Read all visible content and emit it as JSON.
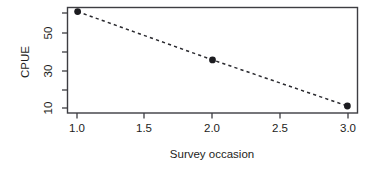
{
  "chart_data": {
    "type": "line",
    "title": "",
    "subtitle": "",
    "xlabel": "Survey occasion",
    "ylabel": "CPUE",
    "x": [
      1.0,
      2.0,
      3.0
    ],
    "values": [
      62,
      25,
      10.5
    ],
    "series": [
      {
        "name": "CPUE",
        "x": [
          1.0,
          2.0,
          3.0
        ],
        "values": [
          62,
          25,
          10.5
        ]
      }
    ],
    "xlim": [
      0.925,
      3.075
    ],
    "ylim": [
      9.2,
      67
    ],
    "yscale": "log",
    "xscale": "linear",
    "grid": false,
    "legend": false,
    "legend_position": "none",
    "line_style": "dashed",
    "marker": "filled-circle",
    "xticks": [
      1.0,
      1.5,
      2.0,
      2.5,
      3.0
    ],
    "xticklabels": [
      "1.0",
      "1.5",
      "2.0",
      "2.5",
      "3.0"
    ],
    "yticks": [
      10,
      20,
      30,
      40,
      50,
      70
    ],
    "yticklabels": [
      "10",
      "",
      "30",
      "",
      "50",
      ""
    ],
    "ytick_labeled": [
      {
        "value": 10,
        "label": "10"
      },
      {
        "value": 30,
        "label": "30"
      },
      {
        "value": 50,
        "label": "50"
      }
    ],
    "annotations": [],
    "colors": {
      "line": "#2b2b30",
      "marker": "#1c1c20",
      "axis": "#3d3d42",
      "text": "#1d1d21",
      "background": "#ffffff"
    }
  },
  "axes": {
    "x_title": "Survey occasion",
    "y_title": "CPUE",
    "x_tick_labels": [
      "1.0",
      "1.5",
      "2.0",
      "2.5",
      "3.0"
    ],
    "y_tick_labels": [
      "50",
      "30",
      "10"
    ]
  }
}
